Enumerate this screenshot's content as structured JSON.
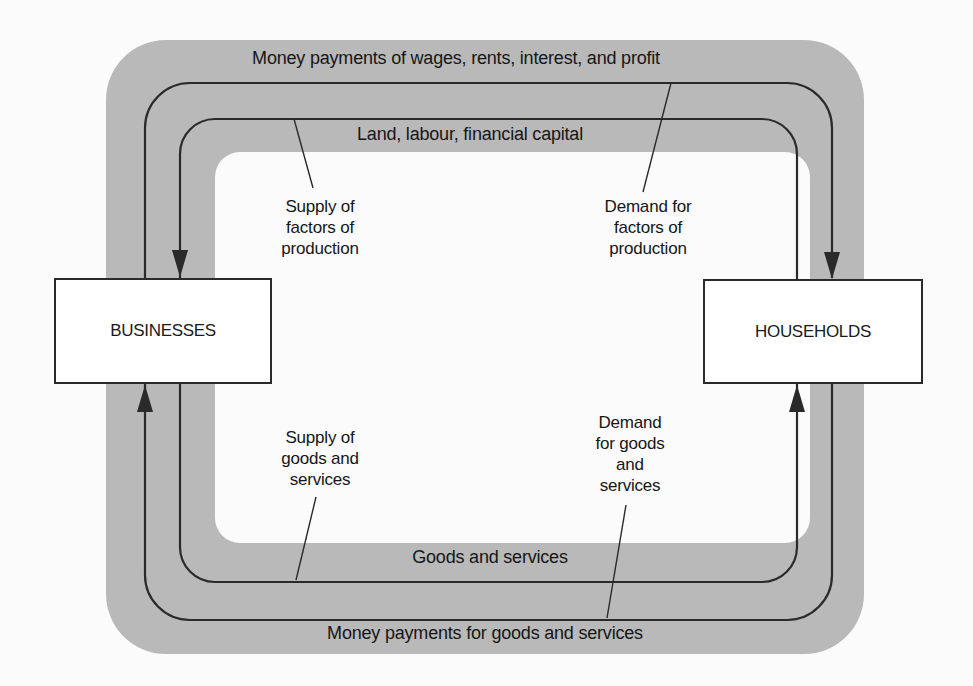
{
  "diagram": {
    "type": "circular-flow",
    "colors": {
      "background": "#fbfbfb",
      "band": "#b9b9b9",
      "line": "#2a2a2a",
      "box_fill": "#ffffff"
    },
    "nodes": {
      "businesses": "BUSINESSES",
      "households": "HOUSEHOLDS"
    },
    "flows": {
      "top_outer": "Money payments of wages, rents, interest, and profit",
      "top_inner": "Land, labour, financial capital",
      "bottom_inner": "Goods and services",
      "bottom_outer": "Money payments for goods and services"
    },
    "annotations": {
      "supply_factors": [
        "Supply of",
        "factors of",
        "production"
      ],
      "demand_factors": [
        "Demand for",
        "factors of",
        "production"
      ],
      "supply_goods": [
        "Supply of",
        "goods and",
        "services"
      ],
      "demand_goods": [
        "Demand",
        "for goods",
        "and",
        "services"
      ]
    }
  }
}
